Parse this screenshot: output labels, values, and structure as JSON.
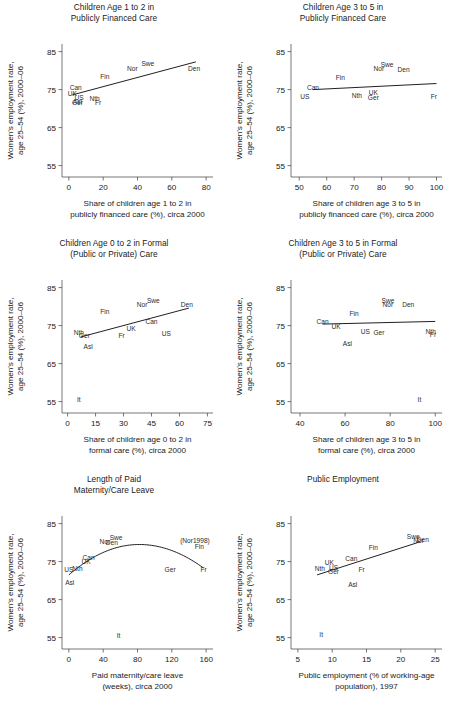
{
  "figure": {
    "width": 457,
    "height": 710,
    "background": "#ffffff",
    "ink": "#1a1a1a"
  },
  "common": {
    "ylabel_line1": "Women's employment rate,",
    "ylabel_line2": "age 25–54 (%), 2000–06",
    "yticks": [
      "55",
      "65",
      "75",
      "85"
    ],
    "ylim": [
      52,
      87
    ]
  },
  "chart_data": [
    {
      "id": "panel-1",
      "type": "scatter",
      "title": "Children Age 1 to 2 in\nPublicly Financed Care",
      "title_line1": "Children Age 1 to 2 in",
      "title_line2": "Publicly Financed Care",
      "xlabel_line1": "Share of children age 1 to 2 in",
      "xlabel_line2": "publicly financed care (%), circa 2000",
      "ylabel": "Women's employment rate, age 25–54 (%), 2000–06",
      "xticks": [
        "0",
        "20",
        "40",
        "60",
        "80"
      ],
      "xlim": [
        -4,
        84
      ],
      "ylim": [
        52,
        87
      ],
      "yticks": [
        "55",
        "65",
        "75",
        "85"
      ],
      "grid": false,
      "legend": "none",
      "points": [
        {
          "label": "Can",
          "x": 4,
          "y": 74.8
        },
        {
          "label": "UK",
          "x": 2,
          "y": 73.3
        },
        {
          "label": "US",
          "x": 6,
          "y": 72.2
        },
        {
          "label": "Asl",
          "x": 5,
          "y": 71.3
        },
        {
          "label": "Ger",
          "x": 5,
          "y": 71.0
        },
        {
          "label": "Nth",
          "x": 15,
          "y": 71.9
        },
        {
          "label": "Fr",
          "x": 17,
          "y": 71.0
        },
        {
          "label": "Fin",
          "x": 21,
          "y": 77.9
        },
        {
          "label": "Nor",
          "x": 37,
          "y": 80.0
        },
        {
          "label": "Swe",
          "x": 46,
          "y": 81.1
        },
        {
          "label": "Den",
          "x": 73,
          "y": 80.0
        }
      ],
      "fit": {
        "type": "linear",
        "x0": 2,
        "y0": 73.6,
        "x1": 74,
        "y1": 82.3
      }
    },
    {
      "id": "panel-2",
      "type": "scatter",
      "title_line1": "Children Age 3 to 5 in",
      "title_line2": "Publicly Financed Care",
      "xlabel_line1": "Share of children age 3 to 5 in",
      "xlabel_line2": "publicly financed care (%), circa 2000",
      "xticks": [
        "50",
        "60",
        "70",
        "80",
        "90",
        "100"
      ],
      "xlim": [
        47,
        102
      ],
      "ylim": [
        52,
        87
      ],
      "yticks": [
        "55",
        "65",
        "75",
        "85"
      ],
      "grid": false,
      "legend": "none",
      "points": [
        {
          "label": "Can",
          "x": 55,
          "y": 74.9
        },
        {
          "label": "US",
          "x": 52,
          "y": 72.6
        },
        {
          "label": "Fin",
          "x": 65,
          "y": 77.6
        },
        {
          "label": "Nth",
          "x": 71,
          "y": 72.7
        },
        {
          "label": "UK",
          "x": 77,
          "y": 73.7
        },
        {
          "label": "Ger",
          "x": 77,
          "y": 72.2
        },
        {
          "label": "Nor",
          "x": 79,
          "y": 80.0
        },
        {
          "label": "Swe",
          "x": 82,
          "y": 81.0
        },
        {
          "label": "Den",
          "x": 88,
          "y": 79.6
        },
        {
          "label": "Fr",
          "x": 99,
          "y": 72.5
        }
      ],
      "fit": {
        "type": "linear",
        "x0": 55,
        "y0": 75.0,
        "x1": 100,
        "y1": 76.6
      }
    },
    {
      "id": "panel-3",
      "type": "scatter",
      "title_line1": "Children Age 0 to 2 in Formal",
      "title_line2": "(Public or Private) Care",
      "xlabel_line1": "Share of children age 0 to 2 in",
      "xlabel_line2": "formal care (%), circa 2000",
      "xticks": [
        "0",
        "15",
        "30",
        "45",
        "60",
        "75"
      ],
      "xlim": [
        -3,
        78
      ],
      "ylim": [
        52,
        87
      ],
      "yticks": [
        "55",
        "65",
        "75",
        "85"
      ],
      "grid": false,
      "legend": "none",
      "points": [
        {
          "label": "Nth",
          "x": 6,
          "y": 72.5
        },
        {
          "label": "Ger",
          "x": 9,
          "y": 71.7
        },
        {
          "label": "Asl",
          "x": 11,
          "y": 68.8
        },
        {
          "label": "It",
          "x": 6,
          "y": 54.9
        },
        {
          "label": "Fin",
          "x": 20,
          "y": 78.0
        },
        {
          "label": "Fr",
          "x": 29,
          "y": 71.7
        },
        {
          "label": "UK",
          "x": 34,
          "y": 73.6
        },
        {
          "label": "Nor",
          "x": 40,
          "y": 80.0
        },
        {
          "label": "Swe",
          "x": 46,
          "y": 81.0
        },
        {
          "label": "Can",
          "x": 45,
          "y": 75.5
        },
        {
          "label": "US",
          "x": 53,
          "y": 72.3
        },
        {
          "label": "Den",
          "x": 64,
          "y": 80.0
        }
      ],
      "fit": {
        "type": "linear",
        "x0": 7,
        "y0": 72.0,
        "x1": 65,
        "y1": 79.6
      }
    },
    {
      "id": "panel-4",
      "type": "scatter",
      "title_line1": "Children Age 3 to 5 in Formal",
      "title_line2": "(Public or Private) Care",
      "xlabel_line1": "Share of children age 3 to 5 in",
      "xlabel_line2": "formal care (%), circa 2000",
      "xticks": [
        "40",
        "60",
        "80",
        "100"
      ],
      "xlim": [
        36,
        103
      ],
      "ylim": [
        52,
        87
      ],
      "yticks": [
        "55",
        "65",
        "75",
        "85"
      ],
      "grid": false,
      "legend": "none",
      "points": [
        {
          "label": "Can",
          "x": 50,
          "y": 75.3
        },
        {
          "label": "UK",
          "x": 56,
          "y": 74.0
        },
        {
          "label": "Fin",
          "x": 64,
          "y": 77.4
        },
        {
          "label": "US",
          "x": 69,
          "y": 72.9
        },
        {
          "label": "Asl",
          "x": 61,
          "y": 69.6
        },
        {
          "label": "Ger",
          "x": 75,
          "y": 72.5
        },
        {
          "label": "Swe",
          "x": 79,
          "y": 81.0
        },
        {
          "label": "Nor",
          "x": 79,
          "y": 80.0
        },
        {
          "label": "Den",
          "x": 88,
          "y": 80.0
        },
        {
          "label": "Nth",
          "x": 98,
          "y": 72.9
        },
        {
          "label": "Fr",
          "x": 99,
          "y": 72.0
        },
        {
          "label": "It",
          "x": 93,
          "y": 55.0
        }
      ],
      "fit": {
        "type": "linear",
        "x0": 50,
        "y0": 75.4,
        "x1": 100,
        "y1": 76.1
      }
    },
    {
      "id": "panel-5",
      "type": "scatter",
      "title_line1": "Length of Paid",
      "title_line2": "Maternity/Care Leave",
      "xlabel_line1": "Paid maternity/care leave",
      "xlabel_line2": "(weeks), circa 2000",
      "xticks": [
        "0",
        "40",
        "80",
        "120",
        "160"
      ],
      "xlim": [
        -8,
        168
      ],
      "ylim": [
        52,
        87
      ],
      "yticks": [
        "55",
        "65",
        "75",
        "85"
      ],
      "grid": false,
      "legend": "none",
      "points": [
        {
          "label": "US",
          "x": 0,
          "y": 72.3
        },
        {
          "label": "Asl",
          "x": 1,
          "y": 68.8
        },
        {
          "label": "Nth",
          "x": 10,
          "y": 72.4
        },
        {
          "label": "UK",
          "x": 20,
          "y": 74.4
        },
        {
          "label": "Can",
          "x": 23,
          "y": 75.4
        },
        {
          "label": "Nor",
          "x": 42,
          "y": 79.6
        },
        {
          "label": "Den",
          "x": 50,
          "y": 79.4
        },
        {
          "label": "Swe",
          "x": 55,
          "y": 80.6
        },
        {
          "label": "It",
          "x": 58,
          "y": 55.0
        },
        {
          "label": "Ger",
          "x": 118,
          "y": 72.2
        },
        {
          "label": "(Nor1998)",
          "x": 147,
          "y": 80.0
        },
        {
          "label": "Fin",
          "x": 152,
          "y": 78.4
        },
        {
          "label": "Fr",
          "x": 157,
          "y": 72.3
        }
      ],
      "fit": {
        "type": "quadratic",
        "vertex_x": 82,
        "vertex_y": 79.5,
        "x_start": 0,
        "x_end": 157,
        "y_start": 71.5,
        "y_end": 73.3
      }
    },
    {
      "id": "panel-6",
      "type": "scatter",
      "title_line1": "Public Employment",
      "title_line2": "",
      "xlabel_line1": "Public employment (% of working-age",
      "xlabel_line2": "population), 1997",
      "xticks": [
        "5",
        "10",
        "15",
        "20",
        "25"
      ],
      "xlim": [
        4,
        26
      ],
      "ylim": [
        52,
        87
      ],
      "yticks": [
        "55",
        "65",
        "75",
        "85"
      ],
      "grid": false,
      "legend": "none",
      "points": [
        {
          "label": "Nth",
          "x": 8.2,
          "y": 72.4
        },
        {
          "label": "UK",
          "x": 9.6,
          "y": 74.2
        },
        {
          "label": "US",
          "x": 10.2,
          "y": 72.9
        },
        {
          "label": "Ger",
          "x": 10.2,
          "y": 71.8
        },
        {
          "label": "It",
          "x": 8.4,
          "y": 55.2
        },
        {
          "label": "Can",
          "x": 12.8,
          "y": 75.2
        },
        {
          "label": "Asl",
          "x": 13.0,
          "y": 68.3
        },
        {
          "label": "Fr",
          "x": 14.3,
          "y": 72.3
        },
        {
          "label": "Fin",
          "x": 16.0,
          "y": 78.0
        },
        {
          "label": "Swe",
          "x": 21.8,
          "y": 81.0
        },
        {
          "label": "Den",
          "x": 23.2,
          "y": 80.1
        },
        {
          "label": "Nor",
          "x": 22.6,
          "y": 79.8
        }
      ],
      "fit": {
        "type": "linear",
        "x0": 7.8,
        "y0": 71.5,
        "x1": 22.8,
        "y1": 80.2
      }
    }
  ]
}
